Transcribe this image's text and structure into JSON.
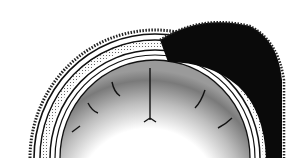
{
  "figure": {
    "colors": {
      "background": "#ffffff",
      "ink": "#111111",
      "hematoma": "#0a0a0a",
      "cortex_shade": "#8a8a8a",
      "bone_fill": "#f4f4f4"
    }
  }
}
